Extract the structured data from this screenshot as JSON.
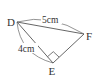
{
  "diagram": {
    "type": "right triangle",
    "vertices": {
      "D": {
        "label": "D",
        "x": 17,
        "y": 22
      },
      "E": {
        "label": "E",
        "x": 53,
        "y": 63
      },
      "F": {
        "label": "F",
        "x": 84,
        "y": 34
      }
    },
    "right_angle_at": "E",
    "measurements": {
      "DF": "5cm",
      "DE": "4cm"
    },
    "colors": {
      "stroke": "#555555",
      "text": "#333333"
    }
  }
}
